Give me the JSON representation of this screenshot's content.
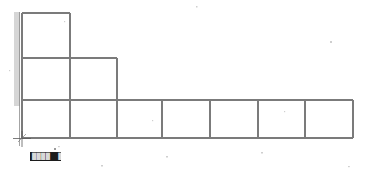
{
  "app": {
    "title": "Structural Frame Elevation",
    "canvas_label": "drawing-canvas"
  },
  "colors": {
    "line": "#7b7b7b",
    "line_dark": "#4a4a4a",
    "hatch": "#6e6e6e",
    "background": "#ffffff",
    "chip_bg": "#1c1c1c",
    "chip_text": "#d8d8d8",
    "marker": "#3a3a3a"
  },
  "status_chip": {
    "visible": true,
    "segment_left": "████",
    "segment_mid": "██",
    "segment_right": "██"
  },
  "support": {
    "name": "fixed-support-hatching",
    "label": "fixed support",
    "base_marker": "origin-cross-marker"
  },
  "chart_data": {
    "type": "diagram",
    "xlabel": "",
    "ylabel": "",
    "xlim": [
      0,
      365
    ],
    "ylim": [
      0,
      174
    ],
    "grid": false,
    "legend": "none",
    "geometry": {
      "x_gridlines": [
        22,
        70,
        117,
        162,
        210,
        258,
        305,
        353
      ],
      "y_levels": [
        13,
        58,
        100,
        138
      ],
      "level_names": [
        "roof",
        "tier-2",
        "tier-3",
        "base"
      ],
      "origin": [
        22,
        138
      ]
    },
    "members": [
      {
        "id": "col-left-upper",
        "type": "column",
        "x1": 22,
        "y1": 13,
        "x2": 22,
        "y2": 58
      },
      {
        "id": "col-left-mid",
        "type": "column",
        "x1": 22,
        "y1": 58,
        "x2": 22,
        "y2": 100
      },
      {
        "id": "col-left-lower",
        "type": "column",
        "x1": 22,
        "y1": 100,
        "x2": 22,
        "y2": 138
      },
      {
        "id": "beam-roof-1",
        "type": "beam",
        "x1": 22,
        "y1": 13,
        "x2": 70,
        "y2": 13
      },
      {
        "id": "col-2-upper",
        "type": "column",
        "x1": 70,
        "y1": 13,
        "x2": 70,
        "y2": 58
      },
      {
        "id": "beam-tier2",
        "type": "beam",
        "x1": 22,
        "y1": 58,
        "x2": 117,
        "y2": 58
      },
      {
        "id": "col-2-mid",
        "type": "column",
        "x1": 70,
        "y1": 58,
        "x2": 70,
        "y2": 100
      },
      {
        "id": "col-3-mid",
        "type": "column",
        "x1": 117,
        "y1": 58,
        "x2": 117,
        "y2": 100
      },
      {
        "id": "beam-tier3",
        "type": "beam",
        "x1": 22,
        "y1": 100,
        "x2": 353,
        "y2": 100
      },
      {
        "id": "col-2-lower",
        "type": "column",
        "x1": 70,
        "y1": 100,
        "x2": 70,
        "y2": 138
      },
      {
        "id": "col-3-lower",
        "type": "column",
        "x1": 117,
        "y1": 100,
        "x2": 117,
        "y2": 138
      },
      {
        "id": "col-4-lower",
        "type": "column",
        "x1": 162,
        "y1": 100,
        "x2": 162,
        "y2": 138
      },
      {
        "id": "col-5-lower",
        "type": "column",
        "x1": 210,
        "y1": 100,
        "x2": 210,
        "y2": 138
      },
      {
        "id": "col-6-lower",
        "type": "column",
        "x1": 258,
        "y1": 100,
        "x2": 258,
        "y2": 138
      },
      {
        "id": "col-7-lower",
        "type": "column",
        "x1": 305,
        "y1": 100,
        "x2": 305,
        "y2": 138
      },
      {
        "id": "col-8-lower",
        "type": "column",
        "x1": 353,
        "y1": 100,
        "x2": 353,
        "y2": 138
      },
      {
        "id": "beam-base",
        "type": "beam",
        "x1": 22,
        "y1": 138,
        "x2": 353,
        "y2": 138
      }
    ],
    "bays": {
      "roof_bay_count": 1,
      "tier2_bay_count": 2,
      "base_bay_count": 7
    }
  }
}
